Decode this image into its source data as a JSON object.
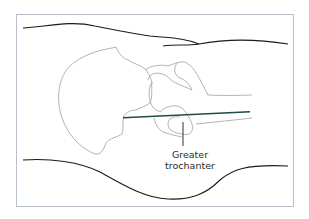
{
  "figure": {
    "annotation": {
      "line1": "Greater",
      "line2": "trochanter"
    },
    "colors": {
      "frame": "#b9bfc9",
      "outline": "#a0a0a0",
      "soft_tissue": "#1a1a1a",
      "needle": "#1f4a48"
    }
  }
}
